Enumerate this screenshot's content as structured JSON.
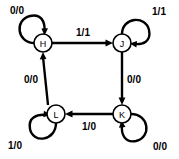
{
  "diagram": {
    "type": "state-transition-diagram",
    "width": 179,
    "height": 159,
    "background_color": "#ffffff",
    "stroke_color": "#000000",
    "nodes": [
      {
        "id": "H",
        "label": "H",
        "cx": 43,
        "cy": 43,
        "r": 9
      },
      {
        "id": "J",
        "label": "J",
        "cx": 122,
        "cy": 43,
        "r": 9
      },
      {
        "id": "L",
        "label": "L",
        "cx": 56,
        "cy": 114,
        "r": 9
      },
      {
        "id": "K",
        "label": "K",
        "cx": 122,
        "cy": 114,
        "r": 9
      }
    ],
    "transitions": [
      {
        "from": "H",
        "to": "J",
        "label": "1/1",
        "label_x": 83,
        "label_y": 32,
        "direction": "right"
      },
      {
        "from": "J",
        "to": "K",
        "label": "0/0",
        "label_x": 134,
        "label_y": 79,
        "direction": "down"
      },
      {
        "from": "K",
        "to": "L",
        "label": "1/0",
        "label_x": 89,
        "label_y": 126,
        "direction": "left"
      },
      {
        "from": "L",
        "to": "H",
        "label": "0/0",
        "label_x": 31,
        "label_y": 79,
        "direction": "up"
      }
    ],
    "self_loops": [
      {
        "state": "H",
        "label": "0/0",
        "label_x": 17,
        "label_y": 10,
        "position": "upper-left"
      },
      {
        "state": "J",
        "label": "1/1",
        "label_x": 159,
        "label_y": 11,
        "position": "upper-right"
      },
      {
        "state": "L",
        "label": "1/0",
        "label_x": 15,
        "label_y": 145,
        "position": "lower-left"
      },
      {
        "state": "K",
        "label": "0/0",
        "label_x": 160,
        "label_y": 146,
        "position": "lower-right"
      }
    ]
  }
}
